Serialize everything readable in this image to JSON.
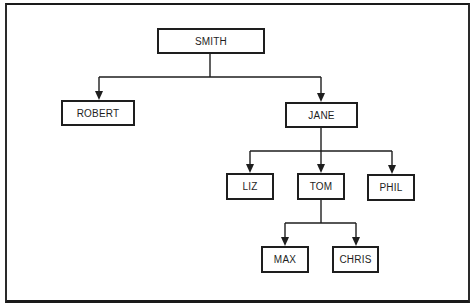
{
  "diagram": {
    "type": "tree",
    "colors": {
      "line": "#1e1e1e",
      "background": "#ffffff"
    },
    "nodes": {
      "smith": {
        "label": "SMITH",
        "x": 157,
        "y": 28,
        "w": 108,
        "h": 26
      },
      "robert": {
        "label": "ROBERT",
        "x": 61,
        "y": 100,
        "w": 74,
        "h": 26
      },
      "jane": {
        "label": "JANE",
        "x": 285,
        "y": 102,
        "w": 73,
        "h": 26
      },
      "liz": {
        "label": "LIZ",
        "x": 226,
        "y": 173,
        "w": 48,
        "h": 27
      },
      "tom": {
        "label": "TOM",
        "x": 297,
        "y": 173,
        "w": 48,
        "h": 27
      },
      "phil": {
        "label": "PHIL",
        "x": 367,
        "y": 174,
        "w": 48,
        "h": 27
      },
      "max": {
        "label": "MAX",
        "x": 261,
        "y": 246,
        "w": 48,
        "h": 27
      },
      "chris": {
        "label": "CHRIS",
        "x": 332,
        "y": 246,
        "w": 47,
        "h": 27
      }
    },
    "edges": [
      {
        "from": "SMITH",
        "to": "ROBERT"
      },
      {
        "from": "SMITH",
        "to": "JANE"
      },
      {
        "from": "JANE",
        "to": "LIZ"
      },
      {
        "from": "JANE",
        "to": "TOM"
      },
      {
        "from": "JANE",
        "to": "PHIL"
      },
      {
        "from": "TOM",
        "to": "MAX"
      },
      {
        "from": "TOM",
        "to": "CHRIS"
      }
    ]
  }
}
